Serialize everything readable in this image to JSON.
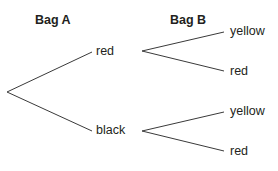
{
  "diagram": {
    "type": "probability-tree",
    "headers": {
      "stage1": "Bag A",
      "stage2": "Bag B"
    },
    "stage1": {
      "branches": [
        {
          "label": "red"
        },
        {
          "label": "black"
        }
      ]
    },
    "stage2": {
      "from_red": [
        {
          "label": "yellow"
        },
        {
          "label": "red"
        }
      ],
      "from_black": [
        {
          "label": "yellow"
        },
        {
          "label": "red"
        }
      ]
    },
    "line_color": "#3a3a3a",
    "text_color": "#231f20"
  }
}
